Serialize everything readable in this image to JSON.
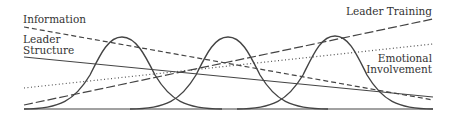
{
  "diagram": {
    "labels": {
      "information": "Information",
      "leader_structure_1": "Leader",
      "leader_structure_2": "Structure",
      "leader_training": "Leader Training",
      "emotional_1": "Emotional",
      "emotional_2": "Involvement"
    },
    "lines": [
      {
        "name": "Information",
        "style": "dashed",
        "from": [
          24,
          27
        ],
        "to": [
          433,
          100
        ]
      },
      {
        "name": "Leader Structure",
        "style": "solid",
        "from": [
          24,
          57
        ],
        "to": [
          433,
          97
        ]
      },
      {
        "name": "Emotional Involvement",
        "style": "dotted",
        "from": [
          24,
          88
        ],
        "to": [
          433,
          44
        ]
      },
      {
        "name": "Leader Training",
        "style": "long-dash",
        "from": [
          24,
          105
        ],
        "to": [
          433,
          19
        ]
      }
    ],
    "bell_curves": [
      {
        "peak_x": 122,
        "peak_y": 37
      },
      {
        "peak_x": 228,
        "peak_y": 37
      },
      {
        "peak_x": 335,
        "peak_y": 36
      }
    ],
    "colors": {
      "stroke": "#444444",
      "text": "#333333"
    }
  }
}
